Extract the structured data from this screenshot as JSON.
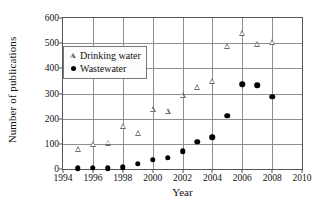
{
  "chart_data": {
    "type": "scatter",
    "title": "",
    "xlabel": "Year",
    "ylabel": "Number of publications",
    "xlim": [
      1994,
      2010
    ],
    "ylim": [
      0,
      600
    ],
    "xticks": [
      "1994",
      "1996",
      "1998",
      "2000",
      "2002",
      "2004",
      "2006",
      "2008",
      "2010"
    ],
    "xtick_values": [
      1994,
      1996,
      1998,
      2000,
      2002,
      2004,
      2006,
      2008,
      2010
    ],
    "yticks": [
      "0",
      "100",
      "200",
      "300",
      "400",
      "500",
      "600"
    ],
    "ytick_values": [
      0,
      100,
      200,
      300,
      400,
      500,
      600
    ],
    "grid": true,
    "legend_position": "upper left inside",
    "x": [
      1995,
      1996,
      1997,
      1998,
      1999,
      2000,
      2001,
      2002,
      2003,
      2004,
      2005,
      2006,
      2007,
      2008
    ],
    "series": [
      {
        "name": "Drinking water",
        "marker": "open-triangle",
        "color": "#6b6b6b",
        "values": [
          80,
          100,
          105,
          170,
          143,
          237,
          232,
          293,
          325,
          350,
          490,
          540,
          495,
          503
        ]
      },
      {
        "name": "Wastewater",
        "marker": "filled-circle",
        "color": "#000000",
        "values": [
          3,
          5,
          3,
          6,
          20,
          36,
          45,
          70,
          108,
          126,
          212,
          336,
          333,
          288
        ]
      }
    ]
  },
  "colors": {
    "axis": "#555555",
    "grid": "#8e8e8e",
    "background": "#ffffff",
    "drinking_water": "#6b6b6b",
    "wastewater": "#000000"
  }
}
